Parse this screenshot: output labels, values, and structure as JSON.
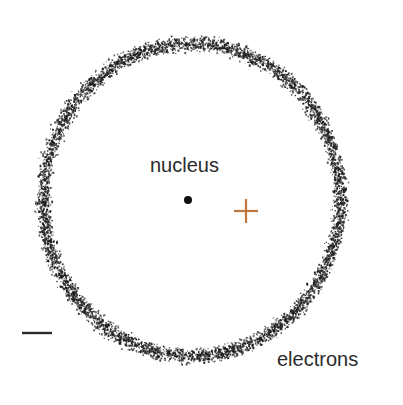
{
  "diagram": {
    "type": "atom-model",
    "labels": {
      "nucleus": "nucleus",
      "electrons": "electrons"
    },
    "symbols": {
      "positive_charge": "+",
      "negative_charge": "−"
    },
    "colors": {
      "background": "#ffffff",
      "ink": "#2b2b2b",
      "stipple": "#1e1e1e",
      "positive_charge": "#c0773f",
      "negative_charge": "#2b2b2b"
    },
    "geometry": {
      "ring": {
        "cx": 191,
        "cy": 199,
        "rx_outer": 159,
        "ry_outer": 167,
        "thickness": 21
      },
      "nucleus_dot": {
        "cx": 188,
        "cy": 200,
        "r": 4
      },
      "plus": {
        "cx": 246,
        "cy": 211,
        "arm": 12
      },
      "minus": {
        "x1": 22,
        "x2": 52,
        "y": 333
      }
    }
  }
}
